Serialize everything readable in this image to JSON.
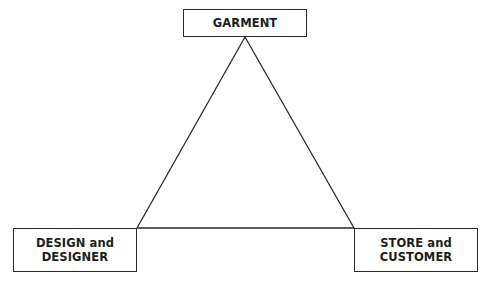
{
  "diagram": {
    "type": "triangle-relationship",
    "nodes": [
      {
        "id": "garment",
        "label": "GARMENT",
        "position": "top"
      },
      {
        "id": "design",
        "label": "DESIGN and\nDESIGNER",
        "position": "bottom-left"
      },
      {
        "id": "store",
        "label": "STORE and\nCUSTOMER",
        "position": "bottom-right"
      }
    ],
    "edges": [
      {
        "from": "garment",
        "to": "design"
      },
      {
        "from": "garment",
        "to": "store"
      },
      {
        "from": "design",
        "to": "store"
      }
    ],
    "colors": {
      "line": "#2a2a2a",
      "text": "#1e1e1e",
      "background": "#ffffff"
    }
  }
}
